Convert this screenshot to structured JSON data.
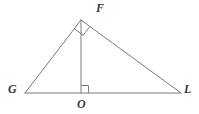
{
  "figure": {
    "name": "right-triangle-with-altitude",
    "background_color": "#ffffff",
    "stroke_color": "#7a7a7a",
    "label_color": "#3a3a3a",
    "stroke_width": 1
  },
  "labels": {
    "apex": "F",
    "left_base": "G",
    "foot": "O",
    "right_base": "L"
  },
  "chart_data": {
    "type": "diagram",
    "title": "",
    "points": {
      "F": {
        "x": 81,
        "y": 20
      },
      "G": {
        "x": 25,
        "y": 93
      },
      "O": {
        "x": 81,
        "y": 93
      },
      "L": {
        "x": 181,
        "y": 93
      }
    },
    "segments": [
      {
        "name": "GF",
        "from": "G",
        "to": "F"
      },
      {
        "name": "FL",
        "from": "F",
        "to": "L"
      },
      {
        "name": "GL",
        "from": "G",
        "to": "L"
      },
      {
        "name": "FO",
        "from": "F",
        "to": "O"
      }
    ],
    "right_angles": [
      {
        "name": "angle-GFL",
        "vertex": "F",
        "between": [
          "FG",
          "FL"
        ]
      },
      {
        "name": "angle-FOL",
        "vertex": "O",
        "between": [
          "OF",
          "OL"
        ]
      }
    ]
  }
}
